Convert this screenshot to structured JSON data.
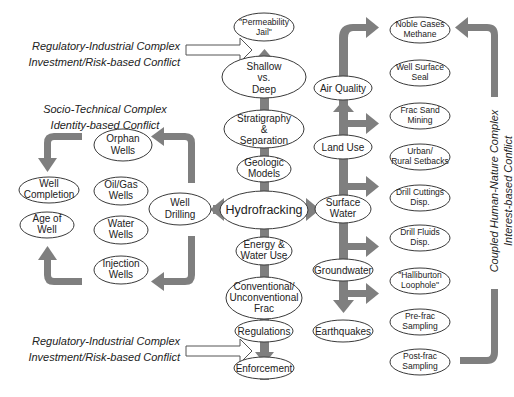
{
  "labels": {
    "reg_top": [
      "Regulatory-Industrial Complex",
      "Investment/Risk-based Conflict"
    ],
    "socio": [
      "Socio-Technical Complex",
      "Identity-based Conflict"
    ],
    "reg_bottom": [
      "Regulatory-Industrial Complex",
      "Investment/Risk-based Conflict"
    ],
    "coupled": [
      "Coupled Human-Nature Complex",
      "Interest-based Conflict"
    ]
  },
  "center_column": [
    {
      "id": "permeability",
      "lines": [
        "\"Permeability",
        "Jail\""
      ]
    },
    {
      "id": "shallow",
      "lines": [
        "Shallow",
        "vs.",
        "Deep"
      ]
    },
    {
      "id": "stratigraphy",
      "lines": [
        "Stratigraphy",
        "&",
        "Separation"
      ]
    },
    {
      "id": "geologic",
      "lines": [
        "Geologic",
        "Models"
      ]
    },
    {
      "id": "hydrofracking",
      "lines": [
        "Hydrofracking"
      ]
    },
    {
      "id": "energy",
      "lines": [
        "Energy &",
        "Water Use"
      ]
    },
    {
      "id": "conventional",
      "lines": [
        "Conventional/",
        "Unconventional",
        "Frac"
      ]
    },
    {
      "id": "regulations",
      "lines": [
        "Regulations"
      ]
    },
    {
      "id": "enforcement",
      "lines": [
        "Enforcement"
      ]
    }
  ],
  "left_cluster": [
    {
      "id": "orphan",
      "lines": [
        "Orphan",
        "Wells"
      ]
    },
    {
      "id": "oilgas",
      "lines": [
        "Oil/Gas",
        "Wells"
      ]
    },
    {
      "id": "water_wells",
      "lines": [
        "Water",
        "Wells"
      ]
    },
    {
      "id": "injection",
      "lines": [
        "Injection",
        "Wells"
      ]
    },
    {
      "id": "completion",
      "lines": [
        "Well",
        "Completion"
      ]
    },
    {
      "id": "age",
      "lines": [
        "Age of",
        "Well"
      ]
    },
    {
      "id": "drilling",
      "lines": [
        "Well",
        "Drilling"
      ]
    }
  ],
  "environment_column": [
    {
      "id": "air",
      "lines": [
        "Air Quality"
      ]
    },
    {
      "id": "land",
      "lines": [
        "Land Use"
      ]
    },
    {
      "id": "surface",
      "lines": [
        "Surface",
        "Water"
      ]
    },
    {
      "id": "groundwater",
      "lines": [
        "Groundwater"
      ]
    },
    {
      "id": "earthquakes",
      "lines": [
        "Earthquakes"
      ]
    }
  ],
  "right_column": [
    {
      "id": "noble",
      "lines": [
        "Noble Gases",
        "Methane"
      ]
    },
    {
      "id": "seal",
      "lines": [
        "Well Surface",
        "Seal"
      ]
    },
    {
      "id": "sand",
      "lines": [
        "Frac Sand",
        "Mining"
      ]
    },
    {
      "id": "setbacks",
      "lines": [
        "Urban/",
        "Rural Setbacks"
      ]
    },
    {
      "id": "cuttings",
      "lines": [
        "Drill Cuttings",
        "Disp."
      ]
    },
    {
      "id": "fluids",
      "lines": [
        "Drill Fluids",
        "Disp."
      ]
    },
    {
      "id": "halliburton",
      "lines": [
        "\"Halliburton",
        "Loophole\""
      ]
    },
    {
      "id": "prefrac",
      "lines": [
        "Pre-frac",
        "Sampling"
      ]
    },
    {
      "id": "postfrac",
      "lines": [
        "Post-frac",
        "Sampling"
      ]
    }
  ],
  "colors": {
    "arrow": "#7f7f7f",
    "stroke": "#3a3a3a",
    "text": "#222222",
    "background": "#ffffff"
  }
}
